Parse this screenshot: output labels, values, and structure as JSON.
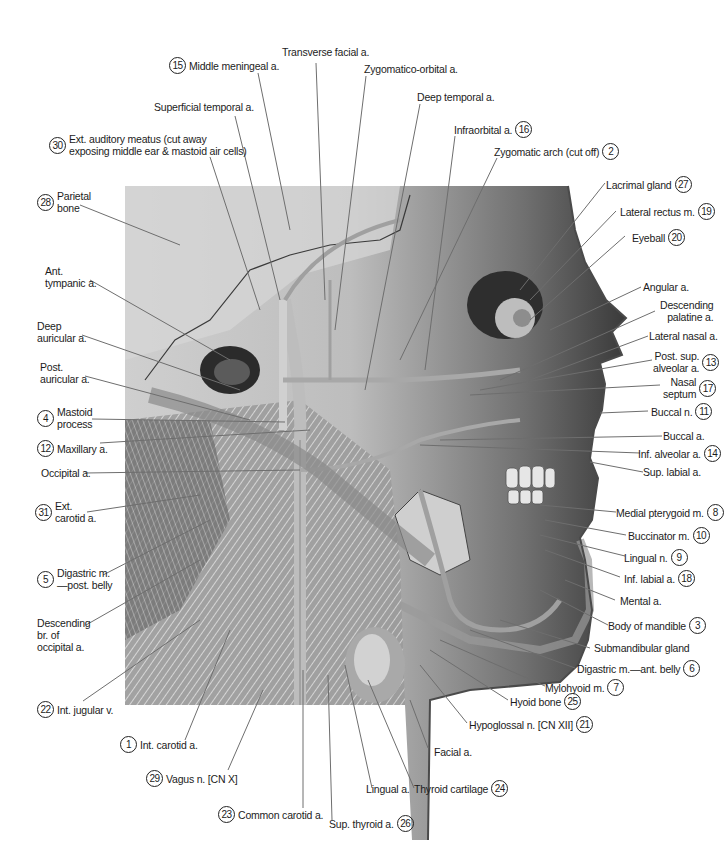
{
  "figure": {
    "colors": {
      "background": "#ffffff",
      "text": "#1c1c1c",
      "leader": "#7a7a7a",
      "illustration_dark": "#2a2a2a",
      "illustration_light": "#d9d9d9"
    }
  },
  "labels": [
    {
      "id": "transverse-facial-a",
      "text": "Transverse facial a.",
      "number": null
    },
    {
      "id": "middle-meningeal-a",
      "text": "Middle meningeal a.",
      "number": "15"
    },
    {
      "id": "zygomatico-orbital-a",
      "text": "Zygomatico-orbital a.",
      "number": null
    },
    {
      "id": "superficial-temporal-a",
      "text": "Superficial temporal a.",
      "number": null
    },
    {
      "id": "deep-temporal-a",
      "text": "Deep temporal a.",
      "number": null
    },
    {
      "id": "ext-auditory-meatus",
      "text": "Ext. auditory meatus (cut away",
      "text2": "exposing middle ear & mastoid air cells)",
      "number": "30"
    },
    {
      "id": "infraorbital-a",
      "text": "Infraorbital a.",
      "number": "16"
    },
    {
      "id": "zygomatic-arch",
      "text": "Zygomatic arch (cut off)",
      "number": "2"
    },
    {
      "id": "parietal-bone",
      "text": "Parietal",
      "text2": "bone",
      "number": "28"
    },
    {
      "id": "lacrimal-gland",
      "text": "Lacrimal gland",
      "number": "27"
    },
    {
      "id": "lateral-rectus-m",
      "text": "Lateral rectus m.",
      "number": "19"
    },
    {
      "id": "eyeball",
      "text": "Eyeball",
      "number": "20"
    },
    {
      "id": "ant-tympanic-a",
      "text": "Ant.",
      "text2": "tympanic a.",
      "number": null
    },
    {
      "id": "angular-a",
      "text": "Angular a.",
      "number": null
    },
    {
      "id": "descending-palatine-a",
      "text": "Descending",
      "text2": "palatine a.",
      "number": null
    },
    {
      "id": "deep-auricular-a",
      "text": "Deep",
      "text2": "auricular a.",
      "number": null
    },
    {
      "id": "lateral-nasal-a",
      "text": "Lateral nasal a.",
      "number": null
    },
    {
      "id": "post-auricular-a",
      "text": "Post.",
      "text2": "auricular a.",
      "number": null
    },
    {
      "id": "post-sup-alveolar-a",
      "text": "Post. sup.",
      "text2": "alveolar a.",
      "number": "13"
    },
    {
      "id": "nasal-septum",
      "text": "Nasal",
      "text2": "septum",
      "number": "17"
    },
    {
      "id": "mastoid-process",
      "text": "Mastoid",
      "text2": "process",
      "number": "4"
    },
    {
      "id": "buccal-n",
      "text": "Buccal n.",
      "number": "11"
    },
    {
      "id": "maxillary-a",
      "text": "Maxillary a.",
      "number": "12"
    },
    {
      "id": "buccal-a",
      "text": "Buccal a.",
      "number": null
    },
    {
      "id": "occipital-a",
      "text": "Occipital a.",
      "number": null
    },
    {
      "id": "inf-alveolar-a",
      "text": "Inf. alveolar a.",
      "number": "14"
    },
    {
      "id": "sup-labial-a",
      "text": "Sup. labial a.",
      "number": null
    },
    {
      "id": "ext-carotid-a",
      "text": "Ext.",
      "text2": "carotid a.",
      "number": "31"
    },
    {
      "id": "medial-pterygoid-m",
      "text": "Medial pterygoid m.",
      "number": "8"
    },
    {
      "id": "buccinator-m",
      "text": "Buccinator m.",
      "number": "10"
    },
    {
      "id": "digastric-post-belly",
      "text": "Digastric m.",
      "text2": "—post. belly",
      "number": "5"
    },
    {
      "id": "lingual-n",
      "text": "Lingual n.",
      "number": "9"
    },
    {
      "id": "inf-labial-a",
      "text": "Inf. labial a.",
      "number": "18"
    },
    {
      "id": "descending-br-occipital-a",
      "text": "Descending",
      "text2": "br. of",
      "text3": "occipital a.",
      "number": null
    },
    {
      "id": "mental-a",
      "text": "Mental a.",
      "number": null
    },
    {
      "id": "body-of-mandible",
      "text": "Body of mandible",
      "number": "3"
    },
    {
      "id": "submandibular-gland",
      "text": "Submandibular gland",
      "number": null
    },
    {
      "id": "digastric-ant-belly",
      "text": "Digastric m.—ant. belly",
      "number": "6"
    },
    {
      "id": "int-jugular-v",
      "text": "Int. jugular v.",
      "number": "22"
    },
    {
      "id": "mylohyoid-m",
      "text": "Mylohyoid m.",
      "number": "7"
    },
    {
      "id": "hyoid-bone",
      "text": "Hyoid bone",
      "number": "25"
    },
    {
      "id": "hypoglossal-n",
      "text": "Hypoglossal n. [CN XII]",
      "number": "21"
    },
    {
      "id": "int-carotid-a",
      "text": "Int. carotid a.",
      "number": "1"
    },
    {
      "id": "facial-a",
      "text": "Facial a.",
      "number": null
    },
    {
      "id": "vagus-n",
      "text": "Vagus n. [CN X]",
      "number": "29"
    },
    {
      "id": "lingual-a",
      "text": "Lingual a.",
      "number": null
    },
    {
      "id": "thyroid-cartilage",
      "text": "Thyroid cartilage",
      "number": "24"
    },
    {
      "id": "common-carotid-a",
      "text": "Common carotid a.",
      "number": "23"
    },
    {
      "id": "sup-thyroid-a",
      "text": "Sup. thyroid a.",
      "number": "26"
    }
  ]
}
